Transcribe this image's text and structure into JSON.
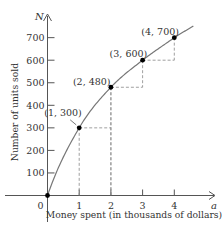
{
  "chart_data": {
    "type": "line",
    "title": "",
    "xlabel": "Money spent (in thousands of dollars)",
    "ylabel": "Number of units sold",
    "x_axis_var": "a",
    "y_axis_var": "N",
    "x_ticks": [
      "0",
      "1",
      "2",
      "3",
      "4"
    ],
    "y_ticks": [
      "100",
      "200",
      "300",
      "400",
      "500",
      "600",
      "700"
    ],
    "xlim": [
      0,
      4.7
    ],
    "ylim": [
      0,
      780
    ],
    "grid": false,
    "points": [
      {
        "x": 0,
        "y": 0,
        "label": ""
      },
      {
        "x": 1,
        "y": 300,
        "label": "(1, 300)"
      },
      {
        "x": 2,
        "y": 480,
        "label": "(2, 480)"
      },
      {
        "x": 3,
        "y": 600,
        "label": "(3, 600)"
      },
      {
        "x": 4,
        "y": 700,
        "label": "(4, 700)"
      }
    ],
    "curve_color": "#777777",
    "point_color": "#000000",
    "guide_style": "dashed"
  }
}
